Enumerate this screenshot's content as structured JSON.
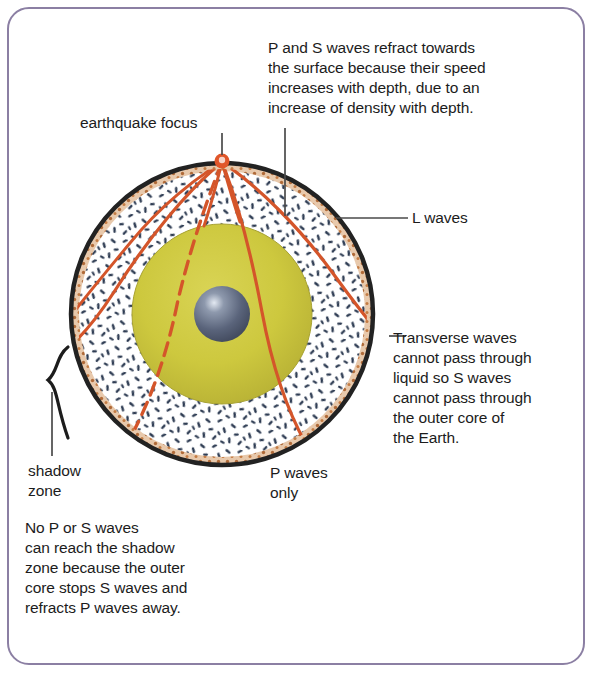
{
  "page": {
    "frame_color": "#8b7fa3"
  },
  "annotations": {
    "top_right": "P and S waves refract towards\nthe surface because their speed\nincreases with depth, due to an\nincrease of density with depth.",
    "focus": "earthquake focus",
    "l_waves": "L  waves",
    "transverse": "Transverse waves\ncannot pass through\nliquid so S waves\ncannot pass through\nthe outer core of\nthe Earth.",
    "shadow_zone": "shadow\nzone",
    "p_waves_only": "P waves\nonly",
    "bottom_left": "No P or S waves\ncan reach the shadow\nzone because the outer\ncore stops S waves and\nrefracts P waves away."
  },
  "earth": {
    "center_x": 222,
    "center_y": 314,
    "radius": 151,
    "layers": [
      {
        "name": "crust",
        "label": "crust rim",
        "outer_radius": 151,
        "color": "#c4713c"
      },
      {
        "name": "mantle",
        "label": "mantle",
        "outer_radius": 145,
        "color": "#fdfdfd"
      },
      {
        "name": "outer-core",
        "label": "outer core",
        "outer_radius": 90,
        "color": "#ccc83f"
      },
      {
        "name": "inner-core",
        "label": "inner core",
        "outer_radius": 28,
        "color": "#5a6478"
      }
    ],
    "focus_marker": {
      "x": 222,
      "y": 160,
      "color": "#e0562a"
    }
  },
  "colors": {
    "ray": "#d4552a",
    "outline": "#222222",
    "leader": "#4a4a4a",
    "mantle_speckle": "#2d3b52",
    "crust_speckle": "#b06a38",
    "outer_core": "#cdc83e",
    "outer_core_shade": "#b0ab36",
    "inner_core": "#59637a",
    "inner_core_light": "#cdd6e4"
  },
  "rays": {
    "description": "Seismic ray paths radiating from the earthquake focus",
    "paths": [
      {
        "name": "s-wave-blocked-left",
        "style": "dashed",
        "note": "S wave stopped by liquid outer core"
      },
      {
        "name": "p-wave-left-mantle",
        "style": "solid",
        "note": "refracts through mantle to surface"
      },
      {
        "name": "p-wave-left-outer",
        "style": "solid",
        "note": "shallow mantle path"
      },
      {
        "name": "p-wave-right-mantle",
        "style": "solid",
        "note": "refracts through mantle to surface"
      },
      {
        "name": "p-wave-right-core",
        "style": "solid",
        "note": "passes through outer core"
      },
      {
        "name": "l-wave-surface-left",
        "style": "solid",
        "note": "surface wave"
      },
      {
        "name": "l-wave-surface-right",
        "style": "solid",
        "note": "surface wave"
      }
    ]
  }
}
